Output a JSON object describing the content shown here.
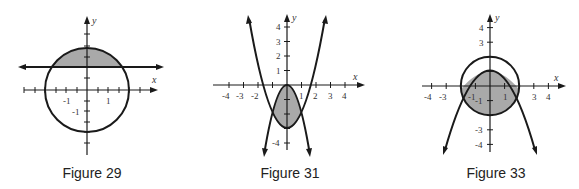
{
  "figures": [
    {
      "id": "figure-29",
      "caption": "Figure 29",
      "description": "Circle x^2 + y^2 = 4 and horizontal line y = 1; region of circle above the line shaded",
      "axis_labels": {
        "x": "x",
        "y": "y"
      },
      "x_tick_labels": [
        "-1",
        "1"
      ],
      "y_tick_labels": [
        "-1"
      ]
    },
    {
      "id": "figure-31",
      "caption": "Figure 31",
      "description": "Parabolas y = x^2 - 3 and y = -2x^2; region between them (x from -1 to 1) shaded",
      "axis_labels": {
        "x": "x",
        "y": "y"
      },
      "x_tick_labels": [
        "-4",
        "-3",
        "-2",
        "1",
        "2",
        "3",
        "4"
      ],
      "y_tick_labels": [
        "4",
        "3",
        "2",
        "1",
        "-4"
      ]
    },
    {
      "id": "figure-33",
      "caption": "Figure 33",
      "description": "Circle x^2 + y^2 = 4 and downward parabola with vertex (0,1); region inside circle and below parabola shaded",
      "axis_labels": {
        "x": "x",
        "y": "y"
      },
      "x_tick_labels": [
        "-4",
        "-3",
        "-1",
        "1",
        "3",
        "4"
      ],
      "y_tick_labels": [
        "4",
        "3",
        "-1",
        "-3",
        "-4"
      ]
    }
  ],
  "colors": {
    "stroke": "#1a1a1a",
    "shade": "#a9a9a9",
    "background": "#ffffff"
  }
}
